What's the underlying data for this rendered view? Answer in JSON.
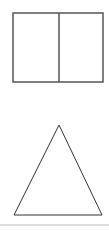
{
  "canvas": {
    "width": 109,
    "height": 230,
    "background": "#ffffff"
  },
  "shapes": {
    "rectangle": {
      "x": 13,
      "y": 13,
      "width": 90,
      "height": 69,
      "stroke": "#555555",
      "stroke_width": 1.5,
      "fill": "#ffffff",
      "divider_x": 59
    },
    "triangle": {
      "points": "59,125 14,215 102,215",
      "stroke": "#333333",
      "stroke_width": 1,
      "fill": "#ffffff"
    },
    "bottom_rule": {
      "y": 225,
      "color": "#bbbbbb"
    }
  }
}
